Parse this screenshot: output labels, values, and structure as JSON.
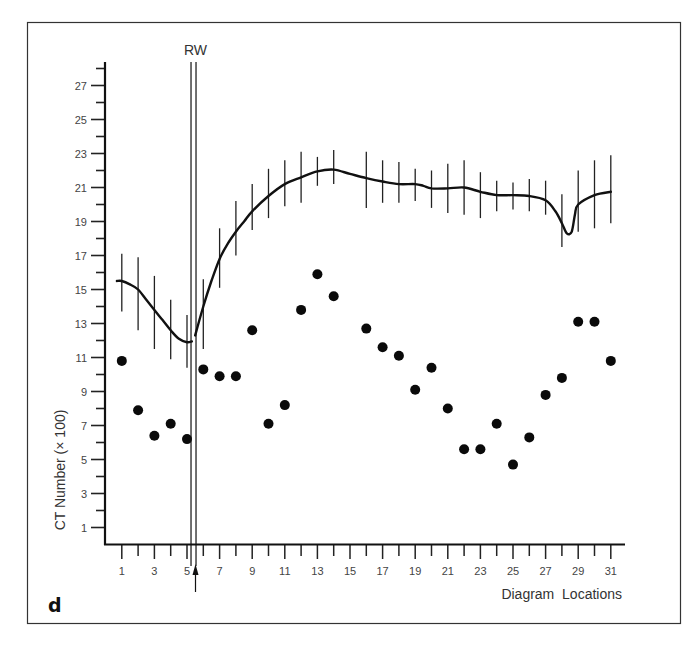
{
  "panel_label": "d",
  "marker_label": "RW",
  "chart_data": {
    "type": "line",
    "title": "",
    "xlabel": "Diagram  Locations",
    "ylabel": "CT Number (× 100)",
    "xlim": [
      0,
      32
    ],
    "ylim": [
      0,
      28.5
    ],
    "x_tick_labels": [
      1,
      3,
      5,
      7,
      9,
      11,
      13,
      15,
      17,
      19,
      21,
      23,
      25,
      27,
      29,
      31
    ],
    "x_minor_ticks": [
      1,
      2,
      3,
      4,
      5,
      6,
      7,
      8,
      9,
      10,
      11,
      12,
      13,
      14,
      15,
      16,
      17,
      18,
      19,
      20,
      21,
      22,
      23,
      24,
      25,
      26,
      27,
      28,
      29,
      30,
      31
    ],
    "y_tick_labels": [
      1,
      3,
      5,
      7,
      9,
      11,
      13,
      15,
      17,
      19,
      21,
      23,
      25,
      27
    ],
    "y_minor_ticks": [
      1,
      2,
      3,
      4,
      5,
      6,
      7,
      8,
      9,
      10,
      11,
      12,
      13,
      14,
      15,
      16,
      17,
      18,
      19,
      20,
      21,
      22,
      23,
      24,
      25,
      26,
      27,
      28
    ],
    "grid": false,
    "legend": null,
    "vertical_marker": {
      "label": "RW",
      "x": 5.4,
      "arrow_below_axis": true
    },
    "series": [
      {
        "name": "Mean CT number (curve with ranges)",
        "kind": "line_with_error_bars",
        "curve_left_of_RW": [
          [
            0.7,
            15.5
          ],
          [
            1,
            15.5
          ],
          [
            1.5,
            15.3
          ],
          [
            2,
            15.0
          ],
          [
            2.5,
            14.4
          ],
          [
            3,
            13.8
          ],
          [
            3.5,
            13.2
          ],
          [
            4,
            12.6
          ],
          [
            4.5,
            12.1
          ],
          [
            5,
            11.9
          ],
          [
            5.3,
            11.95
          ]
        ],
        "curve_right_of_RW": [
          [
            5.5,
            12.3
          ],
          [
            6,
            14.0
          ],
          [
            6.5,
            15.5
          ],
          [
            7,
            16.8
          ],
          [
            7.5,
            17.7
          ],
          [
            8,
            18.4
          ],
          [
            8.5,
            19.0
          ],
          [
            9,
            19.6
          ],
          [
            10,
            20.5
          ],
          [
            11,
            21.2
          ],
          [
            12,
            21.6
          ],
          [
            13,
            21.95
          ],
          [
            14,
            22.05
          ],
          [
            15,
            21.8
          ],
          [
            16,
            21.55
          ],
          [
            17,
            21.35
          ],
          [
            18,
            21.2
          ],
          [
            19,
            21.2
          ],
          [
            19.5,
            21.1
          ],
          [
            20,
            20.95
          ],
          [
            21,
            20.95
          ],
          [
            22,
            21.0
          ],
          [
            23,
            20.75
          ],
          [
            24,
            20.55
          ],
          [
            25,
            20.55
          ],
          [
            26,
            20.5
          ],
          [
            27,
            20.25
          ],
          [
            27.6,
            19.6
          ],
          [
            28,
            18.9
          ],
          [
            28.3,
            18.3
          ],
          [
            28.6,
            18.4
          ],
          [
            28.8,
            19.4
          ],
          [
            29,
            20.0
          ],
          [
            30,
            20.55
          ],
          [
            31,
            20.75
          ]
        ],
        "error_bars": [
          {
            "x": 1,
            "low": 13.7,
            "high": 17.1
          },
          {
            "x": 2,
            "low": 12.6,
            "high": 16.9
          },
          {
            "x": 3,
            "low": 11.5,
            "high": 15.8
          },
          {
            "x": 4,
            "low": 10.9,
            "high": 14.4
          },
          {
            "x": 5,
            "low": 10.4,
            "high": 13.5
          },
          {
            "x": 6,
            "low": 11.5,
            "high": 15.6
          },
          {
            "x": 7,
            "low": 15.1,
            "high": 18.6
          },
          {
            "x": 8,
            "low": 17.0,
            "high": 20.2
          },
          {
            "x": 9,
            "low": 18.5,
            "high": 21.2
          },
          {
            "x": 10,
            "low": 19.2,
            "high": 22.1
          },
          {
            "x": 11,
            "low": 19.9,
            "high": 22.6
          },
          {
            "x": 12,
            "low": 20.1,
            "high": 23.1
          },
          {
            "x": 13,
            "low": 21.1,
            "high": 22.8
          },
          {
            "x": 14,
            "low": 21.2,
            "high": 23.2
          },
          {
            "x": 16,
            "low": 19.8,
            "high": 23.1
          },
          {
            "x": 17,
            "low": 20.1,
            "high": 22.6
          },
          {
            "x": 18,
            "low": 20.1,
            "high": 22.5
          },
          {
            "x": 19,
            "low": 20.2,
            "high": 22.1
          },
          {
            "x": 20,
            "low": 19.8,
            "high": 22.0
          },
          {
            "x": 21,
            "low": 19.5,
            "high": 22.4
          },
          {
            "x": 22,
            "low": 19.4,
            "high": 22.6
          },
          {
            "x": 23,
            "low": 19.2,
            "high": 21.9
          },
          {
            "x": 24,
            "low": 19.6,
            "high": 21.4
          },
          {
            "x": 25,
            "low": 19.7,
            "high": 21.3
          },
          {
            "x": 26,
            "low": 19.6,
            "high": 21.5
          },
          {
            "x": 27,
            "low": 19.4,
            "high": 21.4
          },
          {
            "x": 28,
            "low": 17.5,
            "high": 20.6
          },
          {
            "x": 29,
            "low": 18.4,
            "high": 22.0
          },
          {
            "x": 30,
            "low": 18.6,
            "high": 22.6
          },
          {
            "x": 31,
            "low": 18.9,
            "high": 22.9
          }
        ]
      },
      {
        "name": "Individual CT number",
        "kind": "scatter",
        "points": [
          {
            "x": 1,
            "y": 10.8
          },
          {
            "x": 2,
            "y": 7.9
          },
          {
            "x": 3,
            "y": 6.4
          },
          {
            "x": 4,
            "y": 7.1
          },
          {
            "x": 5,
            "y": 6.2
          },
          {
            "x": 6,
            "y": 10.3
          },
          {
            "x": 7,
            "y": 9.9
          },
          {
            "x": 8,
            "y": 9.9
          },
          {
            "x": 9,
            "y": 12.6
          },
          {
            "x": 10,
            "y": 7.1
          },
          {
            "x": 11,
            "y": 8.2
          },
          {
            "x": 12,
            "y": 13.8
          },
          {
            "x": 13,
            "y": 15.9
          },
          {
            "x": 14,
            "y": 14.6
          },
          {
            "x": 16,
            "y": 12.7
          },
          {
            "x": 17,
            "y": 11.6
          },
          {
            "x": 18,
            "y": 11.1
          },
          {
            "x": 19,
            "y": 9.1
          },
          {
            "x": 20,
            "y": 10.4
          },
          {
            "x": 21,
            "y": 8.0
          },
          {
            "x": 22,
            "y": 5.6
          },
          {
            "x": 23,
            "y": 5.6
          },
          {
            "x": 24,
            "y": 7.1
          },
          {
            "x": 25,
            "y": 4.7
          },
          {
            "x": 26,
            "y": 6.3
          },
          {
            "x": 27,
            "y": 8.8
          },
          {
            "x": 28,
            "y": 9.8
          },
          {
            "x": 29,
            "y": 13.1
          },
          {
            "x": 30,
            "y": 13.1
          },
          {
            "x": 31,
            "y": 10.8
          }
        ]
      }
    ]
  }
}
